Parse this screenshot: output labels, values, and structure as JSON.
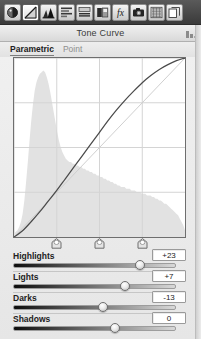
{
  "toolbar": {
    "buttons": [
      {
        "name": "basic-panel-icon",
        "label": "Basic",
        "selected": false
      },
      {
        "name": "tone-curve-icon",
        "label": "Tone Curve",
        "selected": true
      },
      {
        "name": "hsl-color-icon",
        "label": "HSL / Color / B&W",
        "selected": false
      },
      {
        "name": "split-toning-icon",
        "label": "Split Toning",
        "selected": false
      },
      {
        "name": "detail-icon",
        "label": "Detail",
        "selected": false
      },
      {
        "name": "lens-corrections-icon",
        "label": "Lens Corrections",
        "selected": false
      },
      {
        "name": "effects-icon",
        "label": "Effects",
        "selected": false
      },
      {
        "name": "camera-calibration-icon",
        "label": "Camera Calibration",
        "selected": false
      },
      {
        "name": "presets-icon",
        "label": "Presets",
        "selected": false
      },
      {
        "name": "snapshots-icon",
        "label": "Snapshots",
        "selected": false
      }
    ]
  },
  "panel": {
    "title": "Tone Curve",
    "menu_icon": "panel-menu-icon"
  },
  "tabs": [
    {
      "label": "Parametric",
      "active": true
    },
    {
      "label": "Point",
      "active": false
    }
  ],
  "graph": {
    "grid_x": [
      0.25,
      0.5,
      0.75
    ],
    "grid_y": [
      0.25,
      0.5,
      0.75
    ],
    "baseline": "diagonal",
    "curve_color": "#4a4a4a",
    "histogram_color": "#e2e2e2",
    "curve_points": [
      [
        0.0,
        0.0
      ],
      [
        0.05,
        0.035
      ],
      [
        0.1,
        0.085
      ],
      [
        0.15,
        0.14
      ],
      [
        0.2,
        0.2
      ],
      [
        0.25,
        0.26
      ],
      [
        0.3,
        0.325
      ],
      [
        0.35,
        0.39
      ],
      [
        0.4,
        0.455
      ],
      [
        0.45,
        0.52
      ],
      [
        0.5,
        0.585
      ],
      [
        0.55,
        0.65
      ],
      [
        0.6,
        0.71
      ],
      [
        0.65,
        0.765
      ],
      [
        0.7,
        0.815
      ],
      [
        0.75,
        0.862
      ],
      [
        0.8,
        0.902
      ],
      [
        0.85,
        0.936
      ],
      [
        0.9,
        0.963
      ],
      [
        0.95,
        0.985
      ],
      [
        1.0,
        1.0
      ]
    ],
    "histogram": [
      0.02,
      0.03,
      0.04,
      0.06,
      0.09,
      0.14,
      0.22,
      0.33,
      0.45,
      0.58,
      0.7,
      0.8,
      0.88,
      0.93,
      0.96,
      0.98,
      0.99,
      1.0,
      0.99,
      0.96,
      0.92,
      0.87,
      0.81,
      0.75,
      0.69,
      0.63,
      0.58,
      0.54,
      0.51,
      0.49,
      0.47,
      0.46,
      0.45,
      0.45,
      0.44,
      0.44,
      0.43,
      0.43,
      0.42,
      0.42,
      0.41,
      0.41,
      0.4,
      0.4,
      0.39,
      0.39,
      0.38,
      0.38,
      0.37,
      0.37,
      0.36,
      0.36,
      0.35,
      0.35,
      0.34,
      0.34,
      0.33,
      0.33,
      0.32,
      0.32,
      0.31,
      0.31,
      0.3,
      0.3,
      0.3,
      0.29,
      0.29,
      0.29,
      0.28,
      0.28,
      0.28,
      0.27,
      0.27,
      0.27,
      0.26,
      0.26,
      0.26,
      0.25,
      0.25,
      0.25,
      0.24,
      0.24,
      0.23,
      0.23,
      0.22,
      0.22,
      0.21,
      0.2,
      0.2,
      0.19,
      0.18,
      0.17,
      0.16,
      0.15,
      0.14,
      0.13,
      0.11,
      0.09,
      0.07,
      0.04
    ],
    "split_markers": [
      {
        "name": "shadows-split-marker",
        "position": 0.25
      },
      {
        "name": "midtones-split-marker",
        "position": 0.5
      },
      {
        "name": "highlights-split-marker",
        "position": 0.75
      }
    ]
  },
  "sliders": [
    {
      "name": "highlights",
      "label": "Highlights",
      "value": "+23",
      "position": 0.78
    },
    {
      "name": "lights",
      "label": "Lights",
      "value": "+7",
      "position": 0.685
    },
    {
      "name": "darks",
      "label": "Darks",
      "value": "-13",
      "position": 0.555
    },
    {
      "name": "shadows",
      "label": "Shadows",
      "value": "0",
      "position": 0.625
    }
  ]
}
